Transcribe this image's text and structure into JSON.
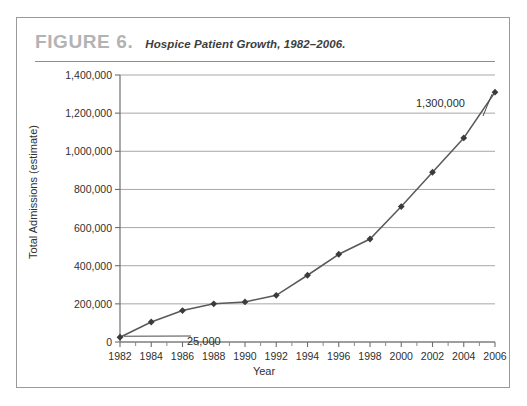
{
  "figure": {
    "label": "FIGURE 6.",
    "caption": "Hospice Patient Growth, 1982–2006."
  },
  "chart_data": {
    "type": "line",
    "title": "Hospice Patient Growth, 1982–2006.",
    "xlabel": "Year",
    "ylabel": "Total Admissions (estimate)",
    "x": [
      1982,
      1984,
      1986,
      1988,
      1990,
      1992,
      1994,
      1996,
      1998,
      2000,
      2002,
      2004,
      2006
    ],
    "values": [
      25000,
      105000,
      165000,
      200000,
      210000,
      245000,
      350000,
      460000,
      540000,
      710000,
      890000,
      1070000,
      1310000
    ],
    "categories": [
      "1982",
      "1984",
      "1986",
      "1988",
      "1990",
      "1992",
      "1994",
      "1996",
      "1998",
      "2000",
      "2002",
      "2004",
      "2006"
    ],
    "xtick_labels": [
      "1982",
      "1984",
      "1986",
      "1988",
      "1990",
      "1992",
      "1994",
      "1996",
      "1998",
      "2000",
      "2002",
      "2004",
      "2006"
    ],
    "ytick_labels": [
      "0",
      "200,000",
      "400,000",
      "600,000",
      "800,000",
      "1,000,000",
      "1,200,000",
      "1,400,000"
    ],
    "ytick_values": [
      0,
      200000,
      400000,
      600000,
      800000,
      1000000,
      1200000,
      1400000
    ],
    "xlim": [
      1981,
      2007
    ],
    "ylim": [
      0,
      1400000
    ],
    "grid": "horizontal",
    "legend": "none",
    "marker": "diamond",
    "line_color": "#595959",
    "marker_color": "#3b3b3b",
    "grid_color": "#9d9d9d",
    "annotations": [
      {
        "text": "25,000",
        "x": 1982,
        "y": 25000
      },
      {
        "text": "1,300,000",
        "x": 2006,
        "y": 1310000
      }
    ]
  }
}
